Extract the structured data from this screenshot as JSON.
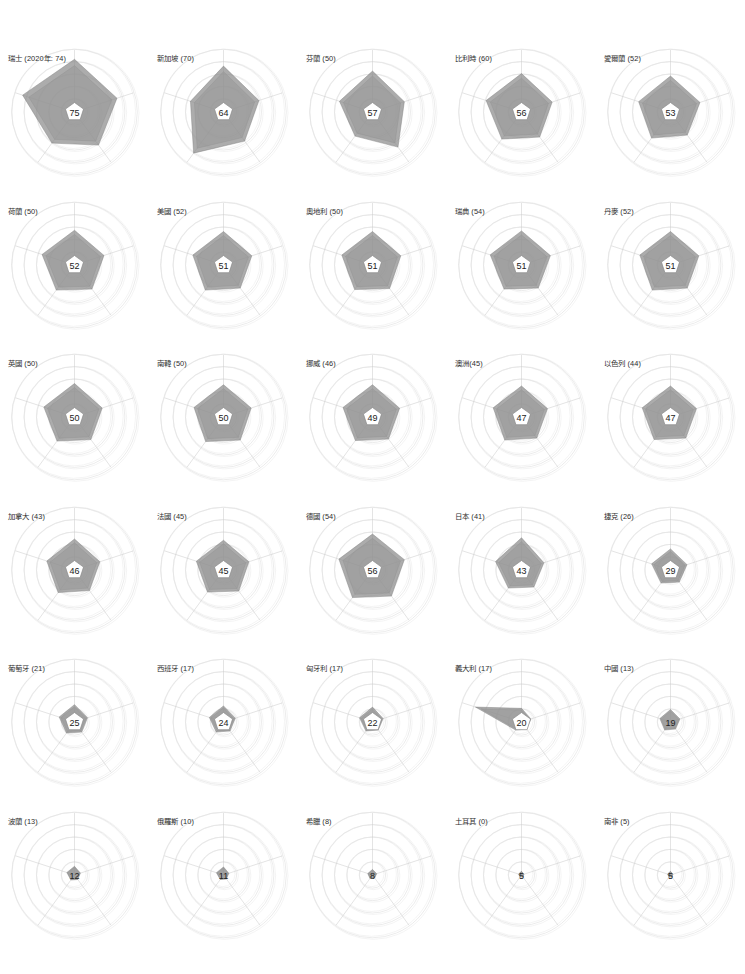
{
  "figure": {
    "type": "small-multiples-radar",
    "columns": 5,
    "rows": 6,
    "axes_count": 5,
    "ring_count": 5,
    "value_max": 100,
    "series_color": "#8c8c8c",
    "grid_color": "#d8d8d8",
    "background": "#ffffff"
  },
  "chart_data": {
    "type": "radar",
    "title": "",
    "xlabel": "",
    "ylabel": "",
    "ylim": [
      0,
      100
    ],
    "grid": true,
    "legend_position": "none",
    "axes": [
      "axis-1",
      "axis-2",
      "axis-3",
      "axis-4",
      "axis-5"
    ],
    "panels": [
      {
        "label": "瑞士 (2020年: 74)",
        "center": "75",
        "values": [
          85,
          72,
          66,
          62,
          88
        ]
      },
      {
        "label": "新加坡 (70)",
        "center": "64",
        "values": [
          74,
          60,
          58,
          82,
          56
        ]
      },
      {
        "label": "芬蘭 (50)",
        "center": "57",
        "values": [
          66,
          54,
          70,
          48,
          56
        ]
      },
      {
        "label": "比利時 (60)",
        "center": "56",
        "values": [
          62,
          52,
          50,
          54,
          60
        ]
      },
      {
        "label": "愛爾蘭 (52)",
        "center": "53",
        "values": [
          58,
          50,
          46,
          52,
          54
        ]
      },
      {
        "label": "荷蘭 (50)",
        "center": "52",
        "values": [
          56,
          50,
          48,
          50,
          55
        ]
      },
      {
        "label": "美國 (52)",
        "center": "51",
        "values": [
          54,
          48,
          46,
          50,
          52
        ]
      },
      {
        "label": "奧地利 (50)",
        "center": "51",
        "values": [
          54,
          48,
          47,
          49,
          52
        ]
      },
      {
        "label": "瑞典 (54)",
        "center": "51",
        "values": [
          55,
          49,
          46,
          48,
          53
        ]
      },
      {
        "label": "丹麥 (52)",
        "center": "51",
        "values": [
          54,
          48,
          46,
          50,
          52
        ]
      },
      {
        "label": "英國 (50)",
        "center": "50",
        "values": [
          54,
          47,
          45,
          48,
          52
        ]
      },
      {
        "label": "南韓 (50)",
        "center": "50",
        "values": [
          52,
          47,
          46,
          49,
          50
        ]
      },
      {
        "label": "挪威 (46)",
        "center": "49",
        "values": [
          52,
          46,
          44,
          47,
          50
        ]
      },
      {
        "label": "澳洲(45)",
        "center": "47",
        "values": [
          50,
          44,
          42,
          46,
          48
        ]
      },
      {
        "label": "以色列 (44)",
        "center": "47",
        "values": [
          50,
          44,
          42,
          45,
          48
        ]
      },
      {
        "label": "加拿大 (43)",
        "center": "46",
        "values": [
          50,
          43,
          41,
          45,
          47
        ]
      },
      {
        "label": "法國 (45)",
        "center": "45",
        "values": [
          48,
          43,
          42,
          44,
          46
        ]
      },
      {
        "label": "德國 (54)",
        "center": "56",
        "values": [
          58,
          54,
          52,
          55,
          57
        ]
      },
      {
        "label": "日本 (41)",
        "center": "43",
        "values": [
          52,
          38,
          34,
          36,
          44
        ]
      },
      {
        "label": "捷克 (26)",
        "center": "29",
        "values": [
          34,
          28,
          24,
          26,
          32
        ]
      },
      {
        "label": "葡萄牙 (21)",
        "center": "25",
        "values": [
          28,
          22,
          20,
          22,
          26
        ]
      },
      {
        "label": "西班牙 (17)",
        "center": "24",
        "values": [
          26,
          20,
          18,
          20,
          24
        ]
      },
      {
        "label": "匈牙利 (17)",
        "center": "22",
        "values": [
          24,
          18,
          16,
          18,
          22
        ]
      },
      {
        "label": "義大利 (17)",
        "center": "20",
        "values": [
          22,
          16,
          14,
          16,
          78
        ]
      },
      {
        "label": "中國 (13)",
        "center": "19",
        "values": [
          20,
          16,
          14,
          16,
          18
        ]
      },
      {
        "label": "波蘭 (13)",
        "center": "12",
        "values": [
          14,
          10,
          9,
          10,
          13
        ]
      },
      {
        "label": "俄羅斯 (10)",
        "center": "11",
        "values": [
          13,
          9,
          8,
          9,
          12
        ]
      },
      {
        "label": "希臘 (8)",
        "center": "8",
        "values": [
          9,
          7,
          6,
          7,
          8
        ]
      },
      {
        "label": "土耳其 (0)",
        "center": "5",
        "values": [
          6,
          4,
          4,
          4,
          5
        ]
      },
      {
        "label": "南非 (5)",
        "center": "5",
        "values": [
          6,
          4,
          4,
          4,
          5
        ]
      }
    ]
  }
}
